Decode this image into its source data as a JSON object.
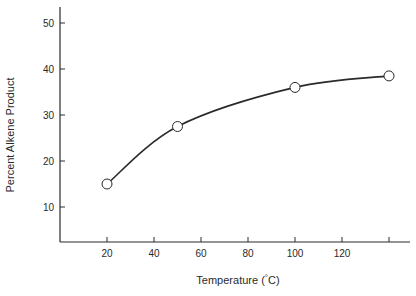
{
  "chart_data": {
    "type": "line",
    "title": "",
    "xlabel": "Temperature (°C)",
    "ylabel": "Percent Alkene Product",
    "xlim": [
      0,
      145
    ],
    "ylim": [
      0,
      55
    ],
    "x_ticks": [
      20,
      40,
      60,
      80,
      100,
      120,
      140
    ],
    "x_tick_labels": [
      "20",
      "40",
      "60",
      "80",
      "100",
      "120",
      ""
    ],
    "y_ticks": [
      10,
      20,
      30,
      40,
      50
    ],
    "y_tick_labels": [
      "10",
      "20",
      "30",
      "40",
      "50"
    ],
    "grid": false,
    "legend": null,
    "series": [
      {
        "name": "Alkene product",
        "marker": "open-circle",
        "line": "smooth",
        "color": "#2a2a2a",
        "x": [
          20,
          50,
          100,
          140
        ],
        "y": [
          15,
          27.5,
          36,
          38.5
        ]
      }
    ]
  },
  "axes": {
    "xlabel_main": "Temperature (",
    "xlabel_deg": "°",
    "xlabel_unit": "C)",
    "ylabel": "Percent Alkene Product"
  }
}
